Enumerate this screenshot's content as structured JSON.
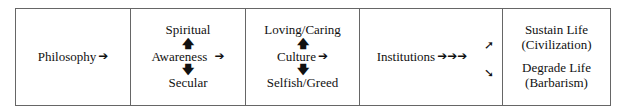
{
  "cells": {
    "philosophy": {
      "label": "Philosophy",
      "arrow": "➔"
    },
    "awareness": {
      "top": "Spiritual",
      "up_arrow": "🡅",
      "label": "Awareness",
      "arrow": "➔",
      "down_arrow": "🡇",
      "bottom": "Secular"
    },
    "culture": {
      "top": "Loving/Caring",
      "up_arrow": "🡅",
      "label": "Culture",
      "arrow": "➔",
      "down_arrow": "🡇",
      "bottom": "Selfish/Greed"
    },
    "institutions": {
      "label": "Institutions",
      "arrows": "➔➔➔",
      "up_right_arrow": "➚",
      "down_right_arrow": "➘"
    },
    "outcomes": {
      "sustain": {
        "line1": "Sustain Life",
        "line2": "(Civilization)"
      },
      "degrade": {
        "line1": "Degrade Life",
        "line2": "(Barbarism)"
      }
    }
  }
}
